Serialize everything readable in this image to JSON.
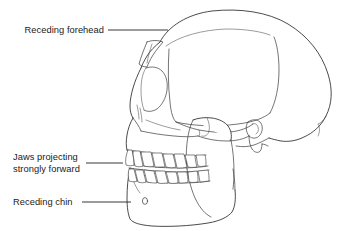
{
  "figure": {
    "view": "left lateral profile",
    "background_color": "#ffffff",
    "line_color": "#2a2a2a",
    "text_color": "#1a1a1a"
  },
  "annotations": [
    {
      "id": "receding-forehead",
      "label": "Receding forehead",
      "label_line1": "Receding forehead",
      "label_line2": "",
      "leader": {
        "from_x": 108,
        "from_y": 30,
        "to_x": 168,
        "to_y": 30
      },
      "text_x": 36,
      "text_y": 33
    },
    {
      "id": "jaws-projecting",
      "label": "Jaws projecting strongly forward",
      "label_line1": "Jaws projecting",
      "label_line2": "strongly forward",
      "leader": {
        "from_x": 86,
        "from_y": 163,
        "to_x": 123,
        "to_y": 163
      },
      "text_x": 13,
      "text_y": 166
    },
    {
      "id": "receding-chin",
      "label": "Receding chin",
      "label_line1": "Receding chin",
      "label_line2": "",
      "leader": {
        "from_x": 82,
        "from_y": 202,
        "to_x": 131,
        "to_y": 202
      },
      "text_x": 13,
      "text_y": 205
    }
  ],
  "anatomy_parts": [
    {
      "id": "cranial-vault",
      "name": "Cranial vault / braincase"
    },
    {
      "id": "brow-ridge",
      "name": "Supraorbital brow ridge"
    },
    {
      "id": "temporal-line",
      "name": "Temporal line"
    },
    {
      "id": "orbit",
      "name": "Eye socket (orbit)"
    },
    {
      "id": "nasal-aperture",
      "name": "Nasal aperture"
    },
    {
      "id": "maxilla",
      "name": "Upper jaw (maxilla)"
    },
    {
      "id": "zygomatic-arch",
      "name": "Cheek bone (zygomatic arch)"
    },
    {
      "id": "mandible",
      "name": "Lower jaw (mandible)"
    },
    {
      "id": "mandibular-ramus",
      "name": "Mandibular ramus"
    },
    {
      "id": "upper-teeth",
      "name": "Upper tooth row"
    },
    {
      "id": "lower-teeth",
      "name": "Lower tooth row"
    },
    {
      "id": "mental-foramen",
      "name": "Mental foramen"
    },
    {
      "id": "occiput",
      "name": "Occipital region"
    },
    {
      "id": "ear-opening",
      "name": "External auditory meatus"
    }
  ],
  "counts": {
    "upper_teeth": 8,
    "lower_teeth": 8,
    "annotations": 3
  }
}
